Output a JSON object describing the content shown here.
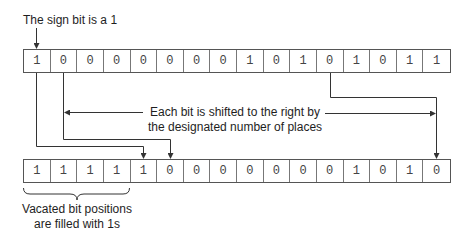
{
  "annotations": {
    "sign_bit": "The sign bit is a 1",
    "shift_line1": "Each bit is shifted to the right by",
    "shift_line2": "the designated number of places",
    "vacated_line1": "Vacated bit positions",
    "vacated_line2": "are filled with 1s"
  },
  "top_register": {
    "bits": [
      "1",
      "0",
      "0",
      "0",
      "0",
      "0",
      "0",
      "0",
      "1",
      "0",
      "1",
      "0",
      "1",
      "0",
      "1",
      "1"
    ]
  },
  "bottom_register": {
    "bits": [
      "1",
      "1",
      "1",
      "1",
      "1",
      "0",
      "0",
      "0",
      "0",
      "0",
      "0",
      "0",
      "1",
      "0",
      "1",
      "0"
    ]
  },
  "colors": {
    "line": "#333333",
    "cell_border": "#777777",
    "text": "#1e1e1e"
  }
}
